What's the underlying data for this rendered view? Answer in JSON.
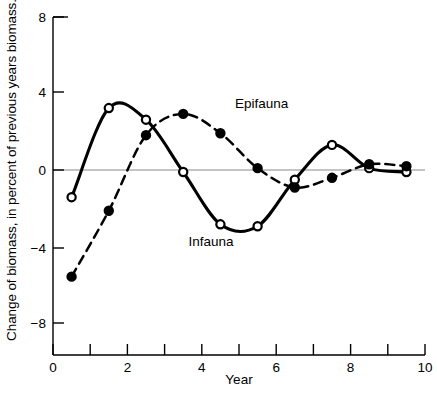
{
  "chart_data": {
    "type": "line",
    "title": "",
    "xlabel": "Year",
    "ylabel": "Change of biomass, in percent of previous years biomass.",
    "xlim": [
      0,
      10
    ],
    "ylim": [
      -8,
      8
    ],
    "xticks": [
      0,
      1,
      2,
      3,
      4,
      5,
      6,
      7,
      8,
      9,
      10
    ],
    "xtick_labels": [
      "0",
      "",
      "2",
      "",
      "4",
      "",
      "6",
      "",
      "8",
      "",
      "10"
    ],
    "yticks": [
      8,
      4,
      0,
      -4,
      -8
    ],
    "ytick_labels": [
      "8",
      "4",
      "0",
      "−4",
      "−8"
    ],
    "grid": false,
    "zero_reference_line": true,
    "legend": "inline-annotations",
    "series": [
      {
        "name": "Infauna",
        "line_style": "solid",
        "marker": "open-circle",
        "x": [
          0.5,
          1.5,
          2.5,
          3.5,
          4.5,
          5.5,
          6.5,
          7.5,
          8.5,
          9.5
        ],
        "values": [
          -1.3,
          3.3,
          2.7,
          0.0,
          -2.7,
          -2.8,
          -0.4,
          1.4,
          0.2,
          0.0
        ]
      },
      {
        "name": "Epifauna",
        "line_style": "dashed",
        "marker": "filled-circle",
        "x": [
          0.5,
          1.5,
          2.5,
          3.5,
          4.5,
          5.5,
          6.5,
          7.5,
          8.5,
          9.5
        ],
        "values": [
          -5.4,
          -2.0,
          1.9,
          3.0,
          2.0,
          0.2,
          -0.8,
          -0.3,
          0.4,
          0.3
        ]
      }
    ],
    "annotations": [
      {
        "text": "Epifauna",
        "x": 4.9,
        "y": 3.4
      },
      {
        "text": "Infauna",
        "x": 4.3,
        "y": -3.9
      }
    ],
    "colors": {
      "line": "#000000",
      "zero_line": "#8a8a8a",
      "background": "#ffffff"
    }
  },
  "axes": {
    "y_title": "Change of biomass, in percent of previous years biomass.",
    "x_title": "Year",
    "y_tick_8": "8",
    "y_tick_4": "4",
    "y_tick_0": "0",
    "y_tick_m4": "−4",
    "y_tick_m8": "−8",
    "x_tick_0": "0",
    "x_tick_2": "2",
    "x_tick_4": "4",
    "x_tick_6": "6",
    "x_tick_8": "8",
    "x_tick_10": "10"
  },
  "labels": {
    "epifauna": "Epifauna",
    "infauna": "Infauna"
  },
  "caption": {
    "text": ""
  }
}
